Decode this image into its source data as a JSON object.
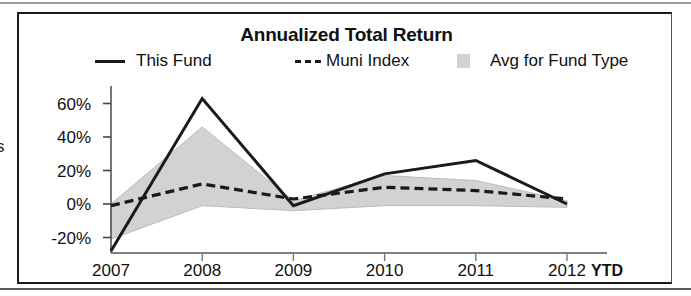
{
  "figure": {
    "title": "Annualized Total Return",
    "axis_caption_fragment": "s",
    "x_axis_suffix": "YTD"
  },
  "legend": {
    "items": [
      {
        "label": "This Fund",
        "marker": "solid-line-swatch",
        "color": "#1a1a1a"
      },
      {
        "label": "Muni Index",
        "marker": "dashed-line-swatch",
        "color": "#1a1a1a"
      },
      {
        "label": "Avg for Fund Type",
        "marker": "gray-box-swatch",
        "color": "#d2d2d2"
      }
    ]
  },
  "chart_data": {
    "type": "line",
    "title": "Annualized Total Return",
    "xlabel": "",
    "ylabel": "",
    "x": [
      "2007",
      "2008",
      "2009",
      "2010",
      "2011",
      "2012"
    ],
    "categories": [
      "2007",
      "2008",
      "2009",
      "2010",
      "2011",
      "2012"
    ],
    "x_tick_labels": [
      "2007",
      "2008",
      "2009",
      "2010",
      "2011",
      "2012"
    ],
    "x_tick_suffix": "YTD",
    "y_tick_labels": [
      "60%",
      "40%",
      "20%",
      "0%",
      "-20%"
    ],
    "y_tick_values": [
      60,
      40,
      20,
      0,
      -20
    ],
    "ylim": [
      -32,
      68
    ],
    "grid": false,
    "legend_position": "top",
    "series": [
      {
        "name": "This Fund",
        "style": "solid",
        "color": "#1a1a1a",
        "values": [
          -28,
          63,
          -1,
          18,
          26,
          0
        ]
      },
      {
        "name": "Muni Index",
        "style": "dashed",
        "color": "#1a1a1a",
        "values": [
          -1,
          12,
          3,
          10,
          8,
          3
        ]
      },
      {
        "name": "Avg for Fund Type",
        "style": "filled-band",
        "color": "#d2d2d2",
        "upper_values": [
          0,
          46,
          2,
          17,
          14,
          2
        ],
        "lower_values": [
          -21,
          -1,
          -4,
          -1,
          -1,
          -2
        ]
      }
    ]
  }
}
